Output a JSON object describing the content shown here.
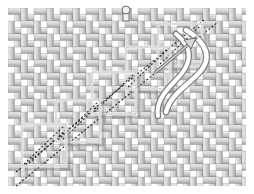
{
  "canvas": {
    "width": 254,
    "height": 194,
    "background": "#ffffff",
    "title": "Woven basket-weave field with ascending staircase outlines"
  },
  "weave": {
    "name": "plain-weave-lattice",
    "field": {
      "x": 8,
      "y": 8,
      "width": 238,
      "height": 178
    },
    "period": 13,
    "strip_thickness": 6.5,
    "colors": {
      "strip_light": "#e8e8e8",
      "strip_mid": "#cfcfcf",
      "strip_dark": "#a8a8a8",
      "strip_edge": "#8f8f8f",
      "gap": "#ffffff"
    },
    "columns": 18,
    "rows": 13
  },
  "staircase": {
    "name": "ascending-box-staircase",
    "step_count": 5,
    "box_size": 44,
    "step_dx": 27,
    "step_dy": -25,
    "outline_color": "#ffffff",
    "shadow_color": "#8a8a8a",
    "boxes": [
      {
        "id": "step-1",
        "x": 22,
        "y": 124,
        "w": 44,
        "h": 42
      },
      {
        "id": "step-2",
        "x": 56,
        "y": 100,
        "w": 44,
        "h": 42
      },
      {
        "id": "step-3",
        "x": 92,
        "y": 72,
        "w": 44,
        "h": 42
      },
      {
        "id": "step-4",
        "x": 126,
        "y": 47,
        "w": 44,
        "h": 42
      },
      {
        "id": "step-5",
        "x": 158,
        "y": 24,
        "w": 44,
        "h": 42
      }
    ]
  },
  "diagonals": {
    "name": "dashed-diagonal-guides",
    "color": "#2a2a2a",
    "dash": "2 2",
    "width": 1.1,
    "lines": [
      {
        "id": "diag-upper",
        "x1": 16,
        "y1": 172,
        "x2": 204,
        "y2": 20
      },
      {
        "id": "diag-lower",
        "x1": 16,
        "y1": 186,
        "x2": 218,
        "y2": 22
      },
      {
        "id": "diag-short-a",
        "x1": 26,
        "y1": 166,
        "x2": 68,
        "y2": 128
      },
      {
        "id": "diag-short-b",
        "x1": 60,
        "y1": 142,
        "x2": 102,
        "y2": 102
      }
    ]
  },
  "ribbon": {
    "name": "curved-ribbon-tail",
    "color_fill": "#ffffff",
    "color_stroke": "#7d7d7d",
    "width": 4.5,
    "path_note": "S-curve falling from the top-right box down to mid-right"
  },
  "arrow": {
    "name": "pointer-arrow",
    "color": "#d8d8d8",
    "stroke": "#6e6e6e",
    "tip": {
      "x": 196,
      "y": 38
    },
    "tail": {
      "x": 156,
      "y": 72
    }
  },
  "knob": {
    "name": "top-knob-marker",
    "cx": 126,
    "cy": 10,
    "r": 4,
    "fill": "#f2f2f2",
    "stroke": "#6a6a6a"
  }
}
